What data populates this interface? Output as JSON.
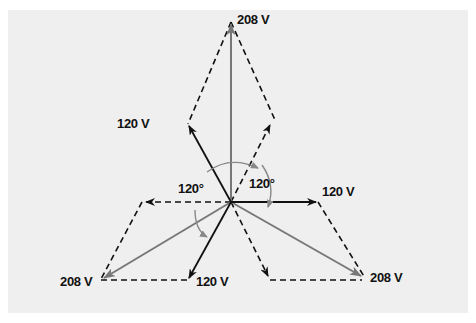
{
  "diagram": {
    "center": [
      231,
      202
    ],
    "colors": {
      "background": "#efefef",
      "phase": "#111111",
      "line": "#777777",
      "arc": "#888888"
    },
    "labels": {
      "line_top": "208 V",
      "phase_upleft": "120 V",
      "phase_right": "120 V",
      "phase_downleft": "120 V",
      "line_downleft": "208 V",
      "line_downright": "208 V",
      "angle_left": "120°",
      "angle_right": "120°"
    }
  }
}
